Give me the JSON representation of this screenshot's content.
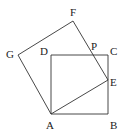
{
  "diagram": {
    "type": "geometry",
    "stroke_color": "#333333",
    "points": {
      "A": {
        "label": "A",
        "x": 51,
        "y": 114,
        "lx": 46,
        "ly": 129
      },
      "B": {
        "label": "B",
        "x": 108,
        "y": 114,
        "lx": 110,
        "ly": 129
      },
      "C": {
        "label": "C",
        "x": 108,
        "y": 55,
        "lx": 110,
        "ly": 55
      },
      "D": {
        "label": "D",
        "x": 51,
        "y": 55,
        "lx": 40,
        "ly": 55
      },
      "E": {
        "label": "E",
        "x": 108,
        "y": 80,
        "lx": 110,
        "ly": 86
      },
      "F": {
        "label": "F",
        "x": 73,
        "y": 21,
        "lx": 70,
        "ly": 16
      },
      "G": {
        "label": "G",
        "x": 18,
        "y": 55,
        "lx": 6,
        "ly": 58
      },
      "P": {
        "label": "P",
        "x": 92,
        "y": 55,
        "lx": 91,
        "ly": 50
      }
    },
    "segments": [
      [
        "A",
        "B"
      ],
      [
        "B",
        "C"
      ],
      [
        "C",
        "D"
      ],
      [
        "D",
        "A"
      ],
      [
        "A",
        "E"
      ],
      [
        "E",
        "F"
      ],
      [
        "F",
        "G"
      ],
      [
        "G",
        "A"
      ]
    ]
  }
}
